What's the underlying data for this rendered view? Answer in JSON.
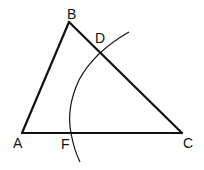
{
  "diagram": {
    "type": "geometry-construction",
    "points": {
      "A": {
        "label": "A",
        "x": 22,
        "y": 133
      },
      "B": {
        "label": "B",
        "x": 69,
        "y": 22
      },
      "C": {
        "label": "C",
        "x": 182,
        "y": 133
      },
      "D": {
        "label": "D",
        "x": 100,
        "y": 52
      },
      "F": {
        "label": "F",
        "x": 71,
        "y": 133
      }
    },
    "segments": [
      "AB",
      "BC",
      "AC"
    ],
    "arc": {
      "description": "arc intersecting BC at D and AC at F"
    },
    "colors": {
      "stroke": "#111111",
      "background": "#ffffff"
    }
  }
}
